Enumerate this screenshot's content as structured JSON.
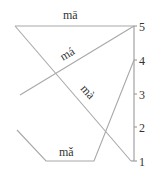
{
  "diagram": {
    "title": "",
    "type": "Mandarin tone contour chart (five-level pitch scale)",
    "axis": {
      "ticks": [
        {
          "label": "5",
          "y": 26
        },
        {
          "label": "4",
          "y": 60
        },
        {
          "label": "3",
          "y": 94
        },
        {
          "label": "2",
          "y": 127
        },
        {
          "label": "1",
          "y": 161
        }
      ]
    },
    "tones": [
      {
        "name": "tone-1",
        "label": "mā",
        "contour": "55"
      },
      {
        "name": "tone-2",
        "label": "má",
        "contour": "35"
      },
      {
        "name": "tone-3",
        "label": "mǎ",
        "contour": "214"
      },
      {
        "name": "tone-4",
        "label": "mà",
        "contour": "51"
      }
    ],
    "colors": {
      "line": "#a8a8a8",
      "text": "#333333"
    }
  }
}
